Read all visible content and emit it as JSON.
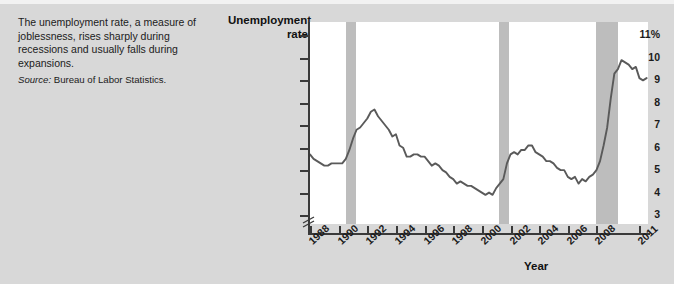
{
  "caption": {
    "body": "The unemployment rate, a measure of joblessness, rises sharply during recessions and usually falls during expansions.",
    "source_label": "Source:",
    "source_value": "Bureau of Labor Statistics."
  },
  "chart_data": {
    "type": "line",
    "title": "",
    "ylabel": "Unemployment rate",
    "xlabel": "Year",
    "ylim": [
      2.6,
      11.6
    ],
    "xlim": [
      1988,
      2011.6
    ],
    "grid": false,
    "legend": null,
    "y_ticks": [
      {
        "value": 11,
        "label": "11%"
      },
      {
        "value": 10,
        "label": "10"
      },
      {
        "value": 9,
        "label": "9"
      },
      {
        "value": 8,
        "label": "8"
      },
      {
        "value": 7,
        "label": "7"
      },
      {
        "value": 6,
        "label": "6"
      },
      {
        "value": 5,
        "label": "5"
      },
      {
        "value": 4,
        "label": "4"
      },
      {
        "value": 3,
        "label": "3"
      }
    ],
    "x_ticks": [
      {
        "value": 1988,
        "label": "1988"
      },
      {
        "value": 1990,
        "label": "1990"
      },
      {
        "value": 1992,
        "label": "1992"
      },
      {
        "value": 1994,
        "label": "1994"
      },
      {
        "value": 1996,
        "label": "1996"
      },
      {
        "value": 1998,
        "label": "1998"
      },
      {
        "value": 2000,
        "label": "2000"
      },
      {
        "value": 2002,
        "label": "2002"
      },
      {
        "value": 2004,
        "label": "2004"
      },
      {
        "value": 2006,
        "label": "2006"
      },
      {
        "value": 2008,
        "label": "2008"
      },
      {
        "value": 2011,
        "label": "2011"
      }
    ],
    "axis_break": true,
    "line_color": "#5a5a5a",
    "recession_color": "#bdbdbd",
    "plot_background": "#ffffff",
    "recessions": [
      {
        "name": "1990-91 recession",
        "start": 1990.5,
        "end": 1991.2
      },
      {
        "name": "2001 recession",
        "start": 2001.2,
        "end": 2001.9
      },
      {
        "name": "2007-09 recession",
        "start": 2007.95,
        "end": 2009.5
      }
    ],
    "series": [
      {
        "name": "Unemployment rate",
        "x": [
          1988.0,
          1988.25,
          1988.5,
          1988.75,
          1989.0,
          1989.25,
          1989.5,
          1989.75,
          1990.0,
          1990.25,
          1990.5,
          1990.75,
          1991.0,
          1991.25,
          1991.5,
          1991.75,
          1992.0,
          1992.25,
          1992.5,
          1992.75,
          1993.0,
          1993.25,
          1993.5,
          1993.75,
          1994.0,
          1994.25,
          1994.5,
          1994.75,
          1995.0,
          1995.25,
          1995.5,
          1995.75,
          1996.0,
          1996.25,
          1996.5,
          1996.75,
          1997.0,
          1997.25,
          1997.5,
          1997.75,
          1998.0,
          1998.25,
          1998.5,
          1998.75,
          1999.0,
          1999.25,
          1999.5,
          1999.75,
          2000.0,
          2000.25,
          2000.5,
          2000.75,
          2001.0,
          2001.25,
          2001.5,
          2001.75,
          2002.0,
          2002.25,
          2002.5,
          2002.75,
          2003.0,
          2003.25,
          2003.5,
          2003.75,
          2004.0,
          2004.25,
          2004.5,
          2004.75,
          2005.0,
          2005.25,
          2005.5,
          2005.75,
          2006.0,
          2006.25,
          2006.5,
          2006.75,
          2007.0,
          2007.25,
          2007.5,
          2007.75,
          2008.0,
          2008.25,
          2008.5,
          2008.75,
          2009.0,
          2009.25,
          2009.5,
          2009.75,
          2010.0,
          2010.25,
          2010.5,
          2010.75,
          2011.0,
          2011.25,
          2011.5
        ],
        "values": [
          5.7,
          5.5,
          5.4,
          5.3,
          5.2,
          5.2,
          5.3,
          5.3,
          5.3,
          5.3,
          5.5,
          5.9,
          6.4,
          6.8,
          6.9,
          7.1,
          7.3,
          7.6,
          7.7,
          7.4,
          7.2,
          7.0,
          6.8,
          6.5,
          6.6,
          6.1,
          6.0,
          5.6,
          5.6,
          5.7,
          5.7,
          5.6,
          5.6,
          5.4,
          5.2,
          5.3,
          5.2,
          5.0,
          4.9,
          4.7,
          4.6,
          4.4,
          4.5,
          4.4,
          4.3,
          4.3,
          4.2,
          4.1,
          4.0,
          3.9,
          4.0,
          3.9,
          4.2,
          4.4,
          4.6,
          5.3,
          5.7,
          5.8,
          5.7,
          5.9,
          5.9,
          6.1,
          6.1,
          5.8,
          5.7,
          5.6,
          5.4,
          5.4,
          5.3,
          5.1,
          5.0,
          5.0,
          4.7,
          4.6,
          4.7,
          4.4,
          4.6,
          4.5,
          4.7,
          4.8,
          5.0,
          5.4,
          6.1,
          6.9,
          8.2,
          9.3,
          9.5,
          9.9,
          9.8,
          9.7,
          9.5,
          9.6,
          9.1,
          9.0,
          9.1
        ]
      }
    ]
  }
}
